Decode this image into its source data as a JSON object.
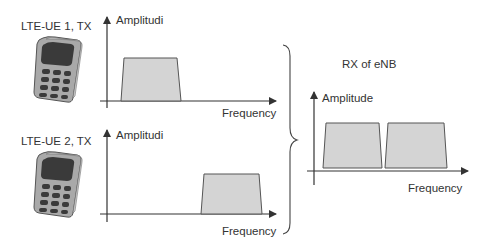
{
  "diagram": {
    "ue1": {
      "label": "LTE-UE 1, TX",
      "icon": "mobile-phone-icon",
      "chart": {
        "y_label": "Amplitudi",
        "x_label": "Frequency",
        "band_position": "low"
      }
    },
    "ue2": {
      "label": "LTE-UE 2, TX",
      "icon": "mobile-phone-icon",
      "chart": {
        "y_label": "Amplitudi",
        "x_label": "Frequency",
        "band_position": "high"
      }
    },
    "enb": {
      "label": "RX of eNB",
      "chart": {
        "y_label": "Amplitude",
        "x_label": "Frequency",
        "bands": [
          "UE 1 band",
          "UE 2 band"
        ]
      }
    },
    "colors": {
      "band_fill": "#d4d4d4",
      "band_stroke": "#555555",
      "axis": "#333333",
      "phone_body": "#b8b8b8",
      "phone_screen": "#3a3a3a"
    }
  }
}
